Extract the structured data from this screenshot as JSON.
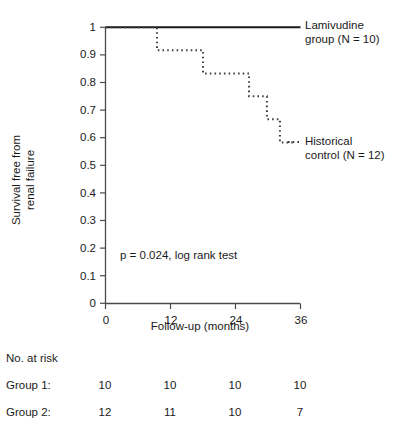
{
  "chart_data": {
    "type": "line",
    "subtype": "kaplan-meier-step",
    "title": "",
    "xlabel": "Follow-up (months)",
    "ylabel": "Survival free from renal failure",
    "xlim": [
      0,
      36
    ],
    "ylim": [
      0,
      1
    ],
    "grid": false,
    "x_ticks": [
      0,
      12,
      24,
      36
    ],
    "x_tick_labels": [
      "0",
      "12",
      "24",
      "36"
    ],
    "y_ticks": [
      0,
      0.1,
      0.2,
      0.3,
      0.4,
      0.5,
      0.6,
      0.7,
      0.8,
      0.9,
      1
    ],
    "y_tick_labels": [
      "0",
      "0.1",
      "0.2",
      "0.3",
      "0.4",
      "0.5",
      "0.6",
      "0.7",
      "0.8",
      "0.9",
      "1"
    ],
    "legend_position": "right-inline",
    "annotations": [
      {
        "text": "p = 0.024, log rank test",
        "x": 12.0,
        "y": 0.145
      }
    ],
    "series": [
      {
        "name": "Lamivudine group (N = 10)",
        "style": "solid",
        "color": "#1a1a1a",
        "x": [
          0,
          36
        ],
        "y": [
          1,
          1
        ],
        "steps": [
          {
            "x": 0,
            "y": 1
          },
          {
            "x": 36,
            "y": 1
          }
        ]
      },
      {
        "name": "Historical control (N = 12)",
        "style": "dotted",
        "color": "#404040",
        "steps": [
          {
            "x": 0,
            "y": 1
          },
          {
            "x": 9.5,
            "y": 1
          },
          {
            "x": 9.5,
            "y": 0.917
          },
          {
            "x": 18.0,
            "y": 0.917
          },
          {
            "x": 18.0,
            "y": 0.833
          },
          {
            "x": 26.5,
            "y": 0.833
          },
          {
            "x": 26.5,
            "y": 0.75
          },
          {
            "x": 29.8,
            "y": 0.75
          },
          {
            "x": 29.8,
            "y": 0.667
          },
          {
            "x": 32.2,
            "y": 0.667
          },
          {
            "x": 32.2,
            "y": 0.583
          },
          {
            "x": 34.6,
            "y": 0.583
          }
        ]
      }
    ]
  },
  "axis": {
    "y_title_line1": "Survival free from",
    "y_title_line2": "renal failure",
    "x_title": "Follow-up (months)",
    "x_tick_labels": [
      "0",
      "12",
      "24",
      "36"
    ],
    "y_tick_labels": [
      "1",
      "0.9",
      "0.8",
      "0.7",
      "0.6",
      "0.5",
      "0.4",
      "0.3",
      "0.2",
      "0.1",
      "0"
    ]
  },
  "legend": {
    "lamivudine": {
      "line1": "Lamivudine",
      "line2": "group (N = 10)",
      "style": "solid"
    },
    "historical": {
      "line1": "Historical",
      "line2": "control (N = 12)",
      "style": "dotted"
    }
  },
  "statistics": {
    "p_value_text": "p = 0.024, log rank test"
  },
  "risk_table": {
    "title": "No. at risk",
    "columns": [
      "0",
      "12",
      "24",
      "36"
    ],
    "rows": [
      {
        "label": "Group 1:",
        "values": [
          "10",
          "10",
          "10",
          "10"
        ]
      },
      {
        "label": "Group 2:",
        "values": [
          "12",
          "11",
          "10",
          "7"
        ]
      }
    ]
  },
  "colors": {
    "axis": "#4a4a4a",
    "solid_line": "#1a1a1a",
    "dotted_line": "#3d3d3d",
    "text": "#1a1a1a",
    "background": "#ffffff"
  }
}
